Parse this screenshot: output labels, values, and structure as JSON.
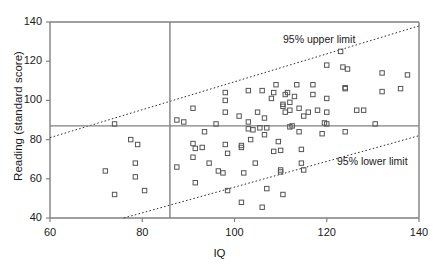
{
  "chart_data": {
    "type": "scatter",
    "title": "",
    "xlabel": "IQ",
    "ylabel": "Reading (standard score)",
    "xlim": [
      60,
      140
    ],
    "ylim": [
      40,
      140
    ],
    "xticks": [
      60,
      80,
      100,
      120,
      140
    ],
    "yticks": [
      40,
      60,
      80,
      100,
      120,
      140
    ],
    "grid": false,
    "legend": "none",
    "marker": "open-square",
    "marker_color": "#555555",
    "axis_color": "#808080",
    "reference_lines": [
      {
        "name": "vertical-iq-cutoff",
        "orientation": "vertical",
        "value": 86,
        "style": "solid"
      },
      {
        "name": "horizontal-reading-mean",
        "orientation": "horizontal",
        "value": 87,
        "style": "solid"
      }
    ],
    "limit_lines": [
      {
        "name": "upper-limit-line",
        "label": "95% upper limit",
        "style": "dotted",
        "x": [
          60,
          140
        ],
        "y": [
          81,
          138
        ]
      },
      {
        "name": "lower-limit-line",
        "label": "95% lower limit",
        "style": "dotted",
        "x": [
          76,
          140
        ],
        "y": [
          40,
          82
        ]
      }
    ],
    "points": [
      [
        72,
        64
      ],
      [
        74,
        52
      ],
      [
        74,
        88
      ],
      [
        77.5,
        80
      ],
      [
        78.5,
        68
      ],
      [
        78.5,
        61
      ],
      [
        79,
        77.5
      ],
      [
        80.5,
        54
      ],
      [
        87.5,
        90
      ],
      [
        87.5,
        66
      ],
      [
        89,
        89
      ],
      [
        91,
        96
      ],
      [
        91,
        71
      ],
      [
        91,
        78
      ],
      [
        91.5,
        58
      ],
      [
        91.5,
        75.5
      ],
      [
        93,
        76
      ],
      [
        93.5,
        84
      ],
      [
        94.5,
        68
      ],
      [
        96,
        88
      ],
      [
        96.5,
        64
      ],
      [
        97.5,
        63
      ],
      [
        98,
        104
      ],
      [
        98,
        100
      ],
      [
        98,
        94
      ],
      [
        98,
        77.5
      ],
      [
        98.5,
        73
      ],
      [
        98.5,
        54
      ],
      [
        101,
        92
      ],
      [
        101.5,
        77
      ],
      [
        101.5,
        76
      ],
      [
        101.5,
        48
      ],
      [
        102,
        63
      ],
      [
        103,
        105
      ],
      [
        103,
        89
      ],
      [
        103,
        85.5
      ],
      [
        103.5,
        80
      ],
      [
        104,
        85
      ],
      [
        104.5,
        68
      ],
      [
        105,
        94
      ],
      [
        105.5,
        86
      ],
      [
        106,
        105
      ],
      [
        106.5,
        82.5
      ],
      [
        106.5,
        91
      ],
      [
        106,
        45.5
      ],
      [
        107,
        55
      ],
      [
        107,
        86
      ],
      [
        108,
        101
      ],
      [
        108.5,
        104
      ],
      [
        108.5,
        74
      ],
      [
        109,
        108
      ],
      [
        109.5,
        79
      ],
      [
        110,
        63.5
      ],
      [
        110,
        64.5
      ],
      [
        110,
        74.5
      ],
      [
        110.5,
        98
      ],
      [
        110.5,
        97
      ],
      [
        110.5,
        52
      ],
      [
        111,
        94
      ],
      [
        111,
        103
      ],
      [
        111.5,
        104
      ],
      [
        112,
        99
      ],
      [
        112,
        95
      ],
      [
        112,
        86.5
      ],
      [
        112.5,
        87
      ],
      [
        113,
        102
      ],
      [
        113.5,
        108
      ],
      [
        114,
        84
      ],
      [
        114,
        96
      ],
      [
        114.5,
        75
      ],
      [
        114.5,
        68
      ],
      [
        115,
        64.5
      ],
      [
        115,
        92
      ],
      [
        116,
        94
      ],
      [
        117,
        108
      ],
      [
        117,
        103
      ],
      [
        118,
        95
      ],
      [
        119,
        83
      ],
      [
        119.5,
        88.5
      ],
      [
        120,
        101
      ],
      [
        120,
        118
      ],
      [
        120,
        94
      ],
      [
        120,
        88
      ],
      [
        123,
        125
      ],
      [
        123.5,
        117
      ],
      [
        124,
        106
      ],
      [
        124,
        106.5
      ],
      [
        124,
        84
      ],
      [
        124.5,
        116
      ],
      [
        126.5,
        95
      ],
      [
        128,
        95
      ],
      [
        130.5,
        88
      ],
      [
        132,
        114
      ],
      [
        132,
        104.5
      ],
      [
        136,
        106
      ],
      [
        137.5,
        113
      ]
    ]
  },
  "labels": {
    "upper_limit": "95% upper limit",
    "lower_limit": "95% lower limit",
    "x_title": "IQ",
    "y_title": "Reading (standard score)"
  }
}
